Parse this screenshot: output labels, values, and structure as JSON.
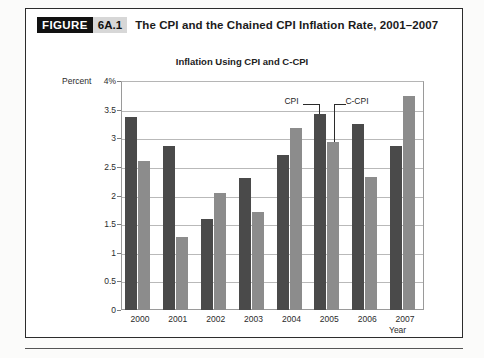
{
  "figure": {
    "badge_word": "FIGURE",
    "badge_number": "6A.1",
    "title": "The CPI and the Chained CPI Inflation Rate, 2001–2007"
  },
  "chart_data": {
    "type": "bar",
    "title": "Inflation Using CPI and C-CPI",
    "xlabel": "Year",
    "ylabel": "Percent",
    "ytick_labels": [
      "4%",
      "3.5",
      "3",
      "2.5",
      "2",
      "1.5",
      "1",
      "0.5",
      "0"
    ],
    "ylim": [
      0,
      4
    ],
    "ytick_step": 0.5,
    "grid": true,
    "legend_position": "inline-callout",
    "categories": [
      "2000",
      "2001",
      "2002",
      "2003",
      "2004",
      "2005",
      "2006",
      "2007"
    ],
    "series": [
      {
        "name": "CPI",
        "color": "#4a4a4a",
        "values": [
          3.37,
          2.87,
          1.59,
          2.31,
          2.7,
          3.43,
          3.25,
          2.87
        ]
      },
      {
        "name": "C-CPI",
        "color": "#8c8c8c",
        "values": [
          2.6,
          1.28,
          2.05,
          1.72,
          3.18,
          2.93,
          2.33,
          3.73
        ]
      }
    ],
    "annotations": [
      {
        "text": "CPI",
        "points_to": "2005 CPI bar"
      },
      {
        "text": "C-CPI",
        "points_to": "2005 C-CPI bar"
      }
    ]
  },
  "colors": {
    "cpi_bar": "#4a4a4a",
    "ccpi_bar": "#8c8c8c",
    "badge_background": "#111111",
    "badge_number_background": "#d7d7d7",
    "gridline": "#b9b9b9"
  }
}
